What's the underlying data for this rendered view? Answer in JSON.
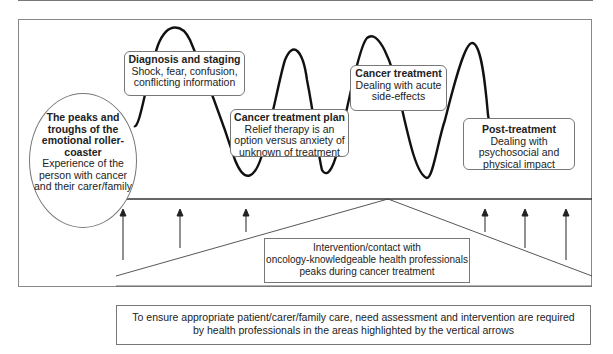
{
  "diagram": {
    "title_ellipse": {
      "title": "The peaks and troughs of the emotional roller-coaster",
      "description": "Experience of the person with cancer and their carer/family"
    },
    "stages": [
      {
        "title": "Diagnosis and staging",
        "description": "Shock, fear, confusion, conflicting information"
      },
      {
        "title": "Cancer treatment plan",
        "description": "Relief therapy is an option versus anxiety of unknown of treatment"
      },
      {
        "title": "Cancer treatment",
        "description": "Dealing with acute side-effects"
      },
      {
        "title": "Post-treatment",
        "description": "Dealing with psychosocial and physical impact"
      }
    ],
    "intervention_note": {
      "line1": "Intervention/contact with",
      "line2": "oncology-knowledgeable health professionals",
      "line3": "peaks during cancer treatment"
    },
    "footer_note": {
      "line1": "To ensure appropriate patient/carer/family care, need assessment and intervention are required",
      "line2": "by health professionals in the areas highlighted by the vertical arrows"
    },
    "vertical_arrows_count": 6,
    "colors": {
      "line": "#111111",
      "border": "#777777",
      "background": "#ffffff"
    }
  }
}
